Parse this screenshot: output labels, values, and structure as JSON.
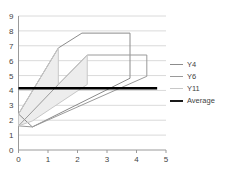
{
  "chart_data": {
    "type": "line",
    "title": "",
    "xlabel": "",
    "ylabel": "",
    "xlim": [
      0,
      5
    ],
    "ylim": [
      0,
      9
    ],
    "xticks": [
      0,
      1,
      2,
      3,
      4,
      5
    ],
    "yticks": [
      0,
      1,
      2,
      3,
      4,
      5,
      6,
      7,
      8,
      9
    ],
    "grid": true,
    "legend_position": "right",
    "series": [
      {
        "name": "Y4",
        "color": "#8c8c8c",
        "closed": true,
        "points": [
          [
            0.0,
            2.42
          ],
          [
            1.35,
            6.85
          ],
          [
            2.15,
            7.85
          ],
          [
            3.78,
            7.85
          ],
          [
            3.78,
            4.82
          ],
          [
            0.47,
            1.55
          ],
          [
            0.0,
            2.42
          ]
        ]
      },
      {
        "name": "Y6",
        "color": "#9a9a9a",
        "closed": true,
        "points": [
          [
            0.47,
            1.55
          ],
          [
            4.35,
            4.95
          ],
          [
            4.35,
            6.38
          ],
          [
            2.33,
            6.38
          ],
          [
            1.35,
            4.4
          ],
          [
            0.0,
            1.62
          ],
          [
            0.47,
            1.55
          ]
        ]
      },
      {
        "name": "Y11",
        "color": "#c8c8c8",
        "closed": true,
        "fill": "#ededed",
        "points": [
          [
            0.0,
            1.62
          ],
          [
            0.0,
            2.42
          ],
          [
            1.35,
            6.85
          ],
          [
            1.35,
            4.4
          ],
          [
            2.33,
            6.38
          ],
          [
            2.33,
            4.4
          ],
          [
            0.47,
            1.95
          ],
          [
            0.0,
            1.62
          ]
        ]
      },
      {
        "name": "Average",
        "color": "#000000",
        "closed": false,
        "thick": true,
        "points": [
          [
            0.0,
            4.15
          ],
          [
            4.7,
            4.15
          ]
        ]
      }
    ]
  },
  "legend": {
    "items": [
      {
        "label": "Y4",
        "color": "#8c8c8c",
        "width": 1.4
      },
      {
        "label": "Y6",
        "color": "#9a9a9a",
        "width": 1.4
      },
      {
        "label": "Y11",
        "color": "#c8c8c8",
        "width": 1.4
      },
      {
        "label": "Average",
        "color": "#1a1a1a",
        "width": 2.6
      }
    ]
  },
  "axes": {
    "grid_color": "#d0d0d0",
    "axis_color": "#9a9a9a",
    "tick_label_color": "#3f3f3f",
    "tick_font_size": 8
  }
}
